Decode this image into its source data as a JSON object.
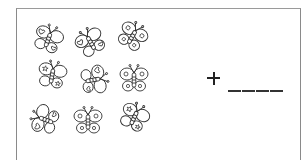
{
  "worksheet": {
    "title": "",
    "counting_group": {
      "object": "butterfly",
      "count": 9,
      "rows": 3,
      "columns": 3,
      "items": [
        {
          "row": 1,
          "col": 1,
          "x": 48,
          "y": 40,
          "rot": 20,
          "pattern": "hearts-stars"
        },
        {
          "row": 1,
          "col": 2,
          "x": 91,
          "y": 43,
          "rot": -30,
          "pattern": "hearts"
        },
        {
          "row": 1,
          "col": 3,
          "x": 132,
          "y": 37,
          "rot": 30,
          "pattern": "circles"
        },
        {
          "row": 2,
          "col": 1,
          "x": 52,
          "y": 76,
          "rot": 10,
          "pattern": "stars"
        },
        {
          "row": 2,
          "col": 2,
          "x": 93,
          "y": 80,
          "rot": 80,
          "pattern": "hearts"
        },
        {
          "row": 2,
          "col": 3,
          "x": 134,
          "y": 80,
          "rot": 0,
          "pattern": "circles"
        },
        {
          "row": 3,
          "col": 1,
          "x": 46,
          "y": 120,
          "rot": -70,
          "pattern": "hearts"
        },
        {
          "row": 3,
          "col": 2,
          "x": 88,
          "y": 122,
          "rot": 0,
          "pattern": "circles"
        },
        {
          "row": 3,
          "col": 3,
          "x": 134,
          "y": 118,
          "rot": 25,
          "pattern": "stars"
        }
      ]
    },
    "operator": "+",
    "answer_blank": "____",
    "answer_segments": 4,
    "colors": {
      "line": "#333333",
      "border": "#8a8a8a",
      "background": "#ffffff"
    }
  }
}
